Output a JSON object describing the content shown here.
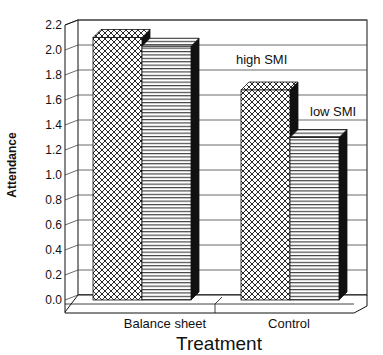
{
  "chart_data": {
    "type": "bar",
    "style": "3d-grouped",
    "title": "",
    "xlabel": "Treatment",
    "ylabel": "Attendance",
    "categories": [
      "Balance sheet",
      "Control"
    ],
    "series": [
      {
        "name": "high SMI",
        "pattern": "crosshatch",
        "values": [
          2.1,
          1.68
        ]
      },
      {
        "name": "low SMI",
        "pattern": "horizontal-lines",
        "values": [
          2.03,
          1.3
        ]
      }
    ],
    "ylim": [
      0.0,
      2.2
    ],
    "yticks": [
      "0.0",
      "0.2",
      "0.4",
      "0.6",
      "0.8",
      "1.0",
      "1.2",
      "1.4",
      "1.6",
      "1.8",
      "2.0",
      "2.2"
    ],
    "grid": true,
    "legend": "inline annotations",
    "annotations": [
      {
        "text": "high SMI",
        "near": "Control high SMI bar"
      },
      {
        "text": "low SMI",
        "near": "Control low SMI bar"
      }
    ]
  },
  "labels": {
    "xtitle": "Treatment",
    "ytitle": "Attendance",
    "cat0": "Balance sheet",
    "cat1": "Control",
    "annot_high": "high SMI",
    "annot_low": "low SMI"
  },
  "colors": {
    "ink": "#111111",
    "paper": "#ffffff",
    "grid": "#444444"
  }
}
